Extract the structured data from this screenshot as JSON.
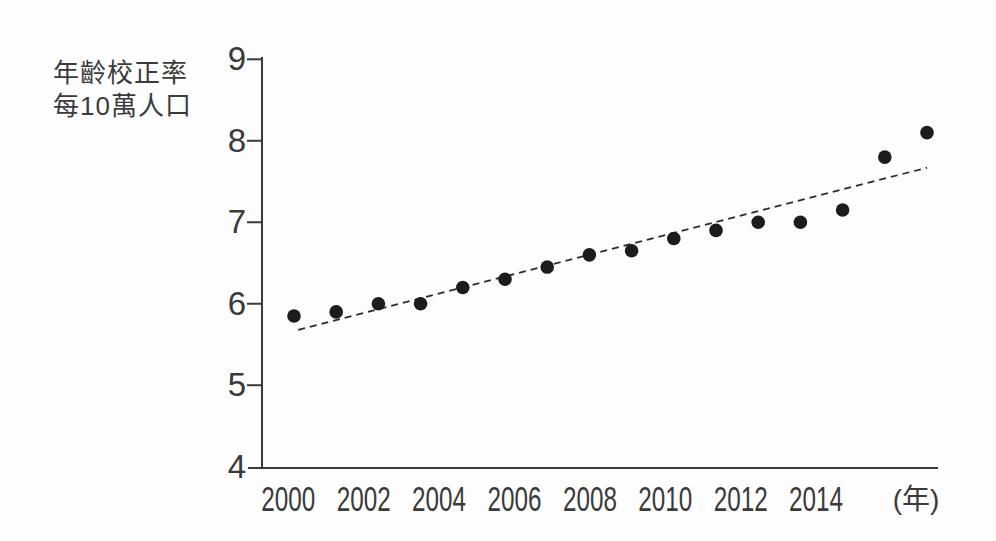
{
  "figure": {
    "background": "#fdfdfd"
  },
  "chart_data": {
    "type": "scatter",
    "title": "",
    "ylabel_lines": [
      "年齡校正率",
      "每10萬人口"
    ],
    "xlabel_unit": "(年)",
    "x": [
      2000,
      2001,
      2002,
      2003,
      2004,
      2005,
      2006,
      2007,
      2008,
      2009,
      2010,
      2011,
      2012,
      2013,
      2014,
      2015
    ],
    "values": [
      5.85,
      5.9,
      6.0,
      6.0,
      6.2,
      6.3,
      6.45,
      6.6,
      6.65,
      6.8,
      6.9,
      7.0,
      7.0,
      7.15,
      7.8,
      8.1
    ],
    "x_ticks": [
      2000,
      2002,
      2004,
      2006,
      2008,
      2010,
      2012,
      2014
    ],
    "y_ticks": [
      9,
      8,
      7,
      6,
      5,
      4
    ],
    "ylim": [
      4,
      9
    ],
    "grid": false,
    "legend": "none",
    "trendline": {
      "style": "dashed",
      "year_start": 2000.1,
      "value_start": 5.68,
      "year_end": 2015.0,
      "value_end": 7.67
    },
    "colors": {
      "point": "#1c1c1c",
      "axis": "#3a3a3a",
      "trend": "#2c2c2c",
      "text": "#3b3b3b"
    }
  }
}
